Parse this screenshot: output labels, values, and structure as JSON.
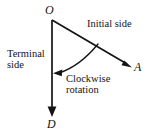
{
  "figure": {
    "type": "geometry-diagram",
    "background_color": "#ffffff",
    "stroke_color": "#141414",
    "vertices": {
      "origin": {
        "label": "O",
        "x": 52,
        "y": 20
      },
      "initial_end": {
        "label": "A",
        "x": 131,
        "y": 67
      },
      "terminal_end": {
        "label": "D",
        "x": 52,
        "y": 116
      }
    },
    "labels": {
      "initial_side": "Initial side",
      "terminal_side_line1": "Terminal",
      "terminal_side_line2": "side",
      "rotation_line1": "Clockwise",
      "rotation_line2": "rotation"
    },
    "rays": [
      {
        "name": "initial-side-ray",
        "from": "O",
        "to": "A",
        "arrow": true
      },
      {
        "name": "terminal-side-ray",
        "from": "O",
        "to": "D",
        "arrow": true
      }
    ],
    "arc": {
      "name": "clockwise-rotation-arc",
      "from_point": {
        "x": 98,
        "y": 44
      },
      "to_point": {
        "x": 54,
        "y": 73
      },
      "arrow": true,
      "direction": "clockwise"
    }
  }
}
